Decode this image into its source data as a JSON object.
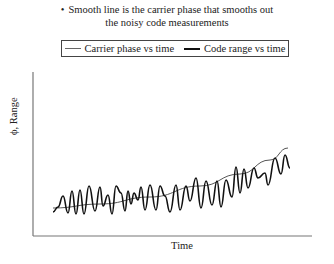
{
  "caption": {
    "bullet": "•",
    "line1": "Smooth line is the carrier phase that smooths out",
    "line2": "the noisy code measurements"
  },
  "legend": {
    "items": [
      {
        "label": "Carrier phase vs time",
        "style": "thin",
        "color": "#666666"
      },
      {
        "label": "Code range vs time",
        "style": "thick",
        "color": "#111111"
      }
    ]
  },
  "axes": {
    "xlabel": "Time",
    "ylabel": "ϕ, Range"
  },
  "chart_data": {
    "type": "line",
    "title": "Smooth line is the carrier phase that smooths out the noisy code measurements",
    "xlabel": "Time",
    "ylabel": "ϕ, Range",
    "grid": false,
    "legend_position": "top",
    "ticks": "none",
    "series": [
      {
        "name": "Carrier phase vs time",
        "description": "smooth, gently rising curve (steeper at the end)",
        "points_px": [
          [
            53,
            208
          ],
          [
            100,
            204
          ],
          [
            150,
            197
          ],
          [
            200,
            186
          ],
          [
            240,
            174
          ],
          [
            270,
            160
          ],
          [
            288,
            148
          ]
        ]
      },
      {
        "name": "Code range vs time",
        "description": "noisy oscillating measurements around carrier phase with growing amplitude",
        "points_px": [
          [
            53,
            212
          ],
          [
            58,
            207
          ],
          [
            63,
            196
          ],
          [
            68,
            213
          ],
          [
            72,
            191
          ],
          [
            76,
            214
          ],
          [
            80,
            190
          ],
          [
            84,
            214
          ],
          [
            89,
            186
          ],
          [
            95,
            211
          ],
          [
            100,
            187
          ],
          [
            103,
            206
          ],
          [
            108,
            195
          ],
          [
            112,
            214
          ],
          [
            116,
            186
          ],
          [
            121,
            193
          ],
          [
            125,
            211
          ],
          [
            128,
            191
          ],
          [
            131,
            204
          ],
          [
            134,
            193
          ],
          [
            138,
            200
          ],
          [
            141,
            187
          ],
          [
            145,
            210
          ],
          [
            150,
            185
          ],
          [
            156,
            210
          ],
          [
            160,
            186
          ],
          [
            165,
            196
          ],
          [
            170,
            212
          ],
          [
            176,
            185
          ],
          [
            180,
            210
          ],
          [
            186,
            186
          ],
          [
            190,
            201
          ],
          [
            196,
            178
          ],
          [
            201,
            208
          ],
          [
            206,
            181
          ],
          [
            212,
            205
          ],
          [
            217,
            181
          ],
          [
            221,
            207
          ],
          [
            226,
            180
          ],
          [
            232,
            197
          ],
          [
            236,
            167
          ],
          [
            240,
            193
          ],
          [
            244,
            169
          ],
          [
            248,
            188
          ],
          [
            254,
            168
          ],
          [
            258,
            178
          ],
          [
            265,
            173
          ],
          [
            268,
            185
          ],
          [
            275,
            158
          ],
          [
            281,
            174
          ],
          [
            285,
            155
          ],
          [
            290,
            168
          ]
        ]
      }
    ]
  }
}
